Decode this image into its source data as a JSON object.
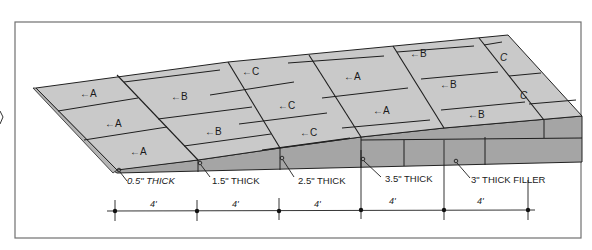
{
  "diagram": {
    "type": "isometric ramp construction diagram",
    "colors": {
      "background": "#ffffff",
      "frame": "#6e6e6e",
      "top_surface": "#c8c8c8",
      "side_face": "#a3a3a3",
      "lines": "#1e1e1e"
    },
    "panel_labels": [
      {
        "id": "p1",
        "text": "←A"
      },
      {
        "id": "p2",
        "text": "←A"
      },
      {
        "id": "p3",
        "text": "←A"
      },
      {
        "id": "p4",
        "text": "←B"
      },
      {
        "id": "p5",
        "text": "←B"
      },
      {
        "id": "p6",
        "text": "←C"
      },
      {
        "id": "p7",
        "text": "←C"
      },
      {
        "id": "p8",
        "text": "←C"
      },
      {
        "id": "p9",
        "text": "←A"
      },
      {
        "id": "p10",
        "text": "←A"
      },
      {
        "id": "p11",
        "text": "←B"
      },
      {
        "id": "p12",
        "text": "←B"
      },
      {
        "id": "p13",
        "text": "←B"
      },
      {
        "id": "p14",
        "text": "C"
      },
      {
        "id": "p15",
        "text": "C"
      }
    ],
    "thickness_callouts": [
      {
        "text": "0.5\" THICK"
      },
      {
        "text": "1.5\" THICK"
      },
      {
        "text": "2.5\" THICK"
      },
      {
        "text": "3.5\" THICK"
      },
      {
        "text": "3\" THICK FILLER"
      }
    ],
    "dimensions": [
      {
        "text": "4'"
      },
      {
        "text": "4'"
      },
      {
        "text": "4'"
      },
      {
        "text": "4'"
      },
      {
        "text": "4'"
      }
    ]
  }
}
